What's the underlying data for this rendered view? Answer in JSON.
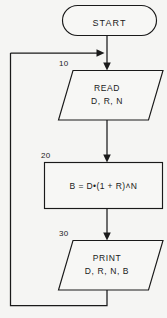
{
  "diagram": {
    "background_color": "#f5f5f3",
    "line_color": "#1a1a1a",
    "shape_fill": "#f7f7f5"
  },
  "nodes": {
    "start": {
      "shape": "terminator",
      "label": "START"
    },
    "read": {
      "shape": "parallelogram-input",
      "line_number": "10",
      "label_line1": "READ",
      "label_line2": "D, R, N"
    },
    "process": {
      "shape": "rectangle-process",
      "line_number": "20",
      "label": "B = D•(1 + R)˄N"
    },
    "print": {
      "shape": "parallelogram-output",
      "line_number": "30",
      "label_line1": "PRINT",
      "label_line2": "D, R, N, B"
    }
  },
  "connectors": {
    "start_to_read": "arrow-down",
    "read_to_process": "arrow-down",
    "process_to_print": "arrow-down",
    "print_loop_back": "arrow-left-up-right-into-main-line"
  }
}
